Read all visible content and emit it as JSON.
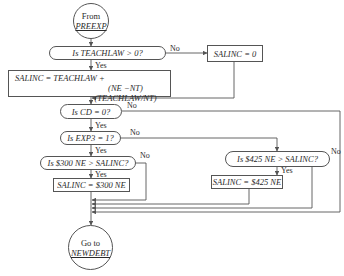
{
  "diagram": {
    "type": "flowchart",
    "start": {
      "line1": "From",
      "line2": "PREEXP"
    },
    "end": {
      "line1": "Go to",
      "line2": "NEWDEBT"
    },
    "nodes": {
      "d_teachlaw": "Is TEACHLAW > 0?",
      "p_salinc_zero": "SALINC = 0",
      "p_formula_line1": "SALINC = TEACHLAW +",
      "p_formula_line2": "(NE −NT) (TEACHLAW/NT)",
      "d_cd": "Is CD = 0?",
      "d_exp3": "Is EXP3 = 1?",
      "d_300": "Is $300 NE > SALINC?",
      "p_300": "SALINC = $300 NE",
      "d_425": "Is $425 NE > SALINC?",
      "p_425": "SALINC = $425 NE"
    },
    "labels": {
      "yes": "Yes",
      "no": "No"
    },
    "edges": [
      {
        "from": "start",
        "to": "d_teachlaw"
      },
      {
        "from": "d_teachlaw",
        "to": "p_formula",
        "label": "Yes"
      },
      {
        "from": "d_teachlaw",
        "to": "p_salinc_zero",
        "label": "No"
      },
      {
        "from": "p_salinc_zero",
        "to": "d_cd"
      },
      {
        "from": "p_formula",
        "to": "d_cd"
      },
      {
        "from": "d_cd",
        "to": "d_exp3",
        "label": "Yes"
      },
      {
        "from": "d_cd",
        "to": "end",
        "label": "No"
      },
      {
        "from": "d_exp3",
        "to": "d_300",
        "label": "Yes"
      },
      {
        "from": "d_exp3",
        "to": "d_425",
        "label": "No"
      },
      {
        "from": "d_300",
        "to": "p_300",
        "label": "Yes"
      },
      {
        "from": "d_300",
        "to": "end",
        "label": "No"
      },
      {
        "from": "p_300",
        "to": "end"
      },
      {
        "from": "d_425",
        "to": "p_425",
        "label": "Yes"
      },
      {
        "from": "d_425",
        "to": "end",
        "label": "No"
      },
      {
        "from": "p_425",
        "to": "end"
      }
    ]
  }
}
